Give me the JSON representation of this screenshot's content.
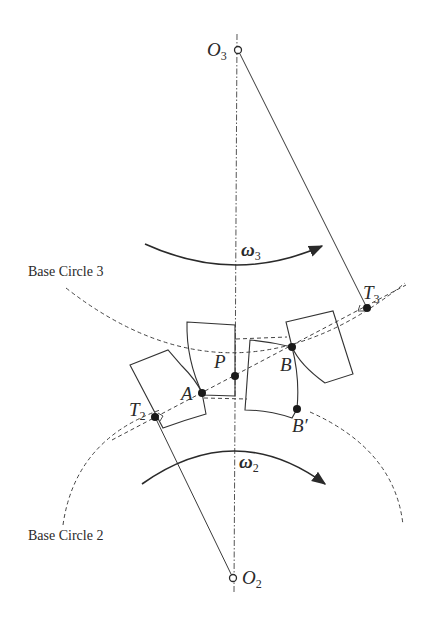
{
  "diagram": {
    "type": "gear meshing / line of action",
    "colors": {
      "stroke": "#3a3a3a",
      "background": "#ffffff",
      "text": "#2a2a2a"
    },
    "centers": {
      "O3": {
        "label": "O",
        "sub": "3",
        "x": 238,
        "y": 50
      },
      "O2": {
        "label": "O",
        "sub": "2",
        "x": 233,
        "y": 578
      }
    },
    "points": {
      "T3": {
        "label": "T",
        "sub": "3",
        "x": 367,
        "y": 308
      },
      "T2": {
        "label": "T",
        "sub": "2",
        "x": 155,
        "y": 417
      },
      "P": {
        "label": "P",
        "x": 235,
        "y": 376
      },
      "A": {
        "label": "A",
        "x": 202,
        "y": 393
      },
      "B": {
        "label": "B",
        "x": 292,
        "y": 347
      },
      "B_prime": {
        "label": "B",
        "prime": "′",
        "x": 297,
        "y": 409
      }
    },
    "angular_velocities": {
      "omega3": {
        "symbol": "ω",
        "sub": "3",
        "direction": "clockwise"
      },
      "omega2": {
        "symbol": "ω",
        "sub": "2",
        "direction": "clockwise"
      }
    },
    "circle_labels": {
      "base3": "Base Circle 3",
      "base2": "Base Circle 2"
    },
    "lines": [
      "center line O3–O2 (dash-dot)",
      "O3–T3 radius (solid)",
      "O2–T2 radius (solid)",
      "line of action T2–T3 (dashed, through A, P, B)"
    ]
  }
}
